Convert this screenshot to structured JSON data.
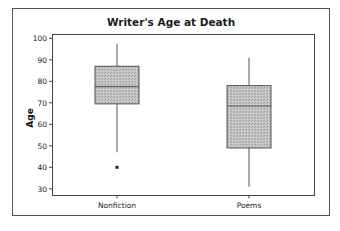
{
  "chart_data": {
    "type": "boxplot",
    "title": "Writer's Age at Death",
    "xlabel": "",
    "ylabel": "Age",
    "ylim": [
      26,
      101
    ],
    "yticks": [
      30,
      40,
      50,
      60,
      70,
      80,
      90,
      100
    ],
    "grid": false,
    "legend": null,
    "categories": [
      "Nonfiction",
      "Poems"
    ],
    "series": [
      {
        "name": "Nonfiction",
        "whisker_low": 47,
        "q1": 69.5,
        "median": 77.5,
        "q3": 87,
        "whisker_high": 97.5,
        "outliers": [
          40
        ]
      },
      {
        "name": "Poems",
        "whisker_low": 31,
        "q1": 49,
        "median": 68.5,
        "q3": 78,
        "whisker_high": 91,
        "outliers": []
      }
    ]
  },
  "style": {
    "box_fill": "#bdbdbd",
    "box_stroke": "#555555",
    "frame_stroke": "#444444",
    "text_color": "#1a1a1a"
  }
}
